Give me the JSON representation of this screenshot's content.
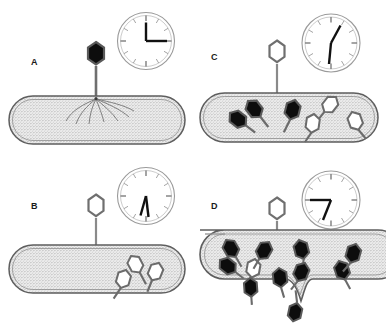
{
  "figure": {
    "caption": "",
    "panel_count": 4,
    "colors": {
      "outline": "#4d4d4d",
      "cell_fill": "#e8e8e8",
      "stipple": "#6b6b6b",
      "phage_filled": "#0d0d0d",
      "phage_empty": "#ffffff",
      "clock_rim": "#8a8a8a",
      "clock_hand": "#111111",
      "background": "#ffffff"
    }
  },
  "panels": [
    {
      "id": "A",
      "letter": "A",
      "stage": "adsorption-and-dna-injection",
      "attached_phage": {
        "head_state": "filled",
        "label": "phage-attached-filled-head"
      },
      "injection_lines": 7,
      "interior_phages": {
        "filled_count": 0,
        "empty_count": 0
      },
      "cell_state": "intact",
      "clock": {
        "label": "clock-panel-a",
        "hour_angle_deg": 90,
        "minute_angle_deg": 0,
        "reading": "3:00",
        "hands": [
          "up",
          "right"
        ]
      }
    },
    {
      "id": "B",
      "letter": "B",
      "stage": "early-assembly",
      "attached_phage": {
        "head_state": "empty",
        "label": "phage-attached-empty-head"
      },
      "injection_lines": 0,
      "interior_phages": {
        "filled_count": 0,
        "empty_count": 3
      },
      "cell_state": "intact",
      "clock": {
        "label": "clock-panel-b",
        "hour_angle_deg": 196,
        "minute_angle_deg": 172,
        "reading": "6:30",
        "hands": [
          "down-left",
          "down"
        ]
      }
    },
    {
      "id": "C",
      "letter": "C",
      "stage": "maturation",
      "attached_phage": {
        "head_state": "empty",
        "label": "phage-attached-empty-head"
      },
      "injection_lines": 0,
      "interior_phages": {
        "filled_count": 3,
        "empty_count": 3
      },
      "cell_state": "intact",
      "clock": {
        "label": "clock-panel-c",
        "hour_angle_deg": 30,
        "minute_angle_deg": 186,
        "reading": "1:00",
        "hands": [
          "up-right",
          "down"
        ]
      }
    },
    {
      "id": "D",
      "letter": "D",
      "stage": "lysis-and-release",
      "attached_phage": {
        "head_state": "empty",
        "label": "phage-attached-empty-head"
      },
      "injection_lines": 0,
      "interior_phages": {
        "filled_count": 11,
        "empty_count": 1
      },
      "cell_state": "lysed",
      "clock": {
        "label": "clock-panel-d",
        "hour_angle_deg": 150,
        "minute_angle_deg": 270,
        "reading": "9:25",
        "hands": [
          "left",
          "down-right"
        ]
      }
    }
  ]
}
